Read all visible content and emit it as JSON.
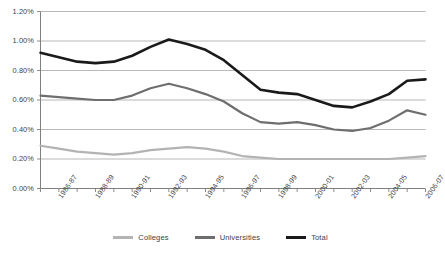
{
  "chart_data": {
    "type": "line",
    "title": "",
    "xlabel": "",
    "ylabel": "",
    "ylim": [
      0.0,
      1.2
    ],
    "ytick_values": [
      0.0,
      0.2,
      0.4,
      0.6,
      0.8,
      1.0,
      1.2
    ],
    "ytick_labels": [
      "0.00%",
      "0.20%",
      "0.40%",
      "0.60%",
      "0.80%",
      "1.00%",
      "1.20%"
    ],
    "grid": "horizontal",
    "legend_position": "bottom-center",
    "categories": [
      "1985-86",
      "1986-87",
      "1987-88",
      "1988-89",
      "1989-90",
      "1990-91",
      "1991-92",
      "1992-93",
      "1993-94",
      "1994-95",
      "1995-96",
      "1996-97",
      "1997-98",
      "1998-99",
      "1999-00",
      "2000-01",
      "2001-02",
      "2002-03",
      "2003-04",
      "2004-05",
      "2005-06",
      "2006-07"
    ],
    "xtick_labels_shown": [
      "1986-87",
      "1988-89",
      "1990-91",
      "1992-93",
      "1994-95",
      "1996-97",
      "1998-99",
      "2000-01",
      "2002-03",
      "2004-05",
      "2006-07"
    ],
    "series": [
      {
        "name": "Colleges",
        "color": "#b3b3b3",
        "values": [
          0.29,
          0.27,
          0.25,
          0.24,
          0.23,
          0.24,
          0.26,
          0.27,
          0.28,
          0.27,
          0.25,
          0.22,
          0.21,
          0.2,
          0.2,
          0.2,
          0.2,
          0.2,
          0.2,
          0.2,
          0.21,
          0.22
        ]
      },
      {
        "name": "Universities",
        "color": "#6e6e6e",
        "values": [
          0.63,
          0.62,
          0.61,
          0.6,
          0.6,
          0.63,
          0.68,
          0.71,
          0.68,
          0.64,
          0.59,
          0.51,
          0.45,
          0.44,
          0.45,
          0.43,
          0.4,
          0.39,
          0.41,
          0.46,
          0.53,
          0.5
        ]
      },
      {
        "name": "Total",
        "color": "#1a1a1a",
        "values": [
          0.92,
          0.89,
          0.86,
          0.85,
          0.86,
          0.9,
          0.96,
          1.01,
          0.98,
          0.94,
          0.87,
          0.77,
          0.67,
          0.65,
          0.64,
          0.6,
          0.56,
          0.55,
          0.59,
          0.64,
          0.73,
          0.74
        ]
      }
    ]
  },
  "legend": {
    "items": [
      {
        "label": "Colleges"
      },
      {
        "label": "Universities"
      },
      {
        "label": "Total"
      }
    ]
  },
  "axis": {
    "y_axis_name": "percent-axis",
    "x_axis_name": "year-axis"
  }
}
